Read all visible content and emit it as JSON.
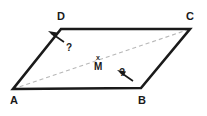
{
  "figure": {
    "type": "geometry-diagram",
    "shape": "parallelogram",
    "background_color": "#ffffff",
    "edge_color": "#1a1a1a",
    "diagonal_color": "#b8b8b8",
    "arrow_color": "#1a1a1a",
    "vertices": [
      {
        "id": "A",
        "label": "A",
        "x": 13,
        "y": 89,
        "label_x": 10,
        "label_y": 95
      },
      {
        "id": "B",
        "label": "B",
        "x": 141,
        "y": 88,
        "label_x": 138,
        "label_y": 95
      },
      {
        "id": "C",
        "label": "C",
        "x": 190,
        "y": 29,
        "label_x": 186,
        "label_y": 11
      },
      {
        "id": "D",
        "label": "D",
        "x": 61,
        "y": 29,
        "label_x": 57,
        "label_y": 11
      }
    ],
    "edges": [
      {
        "name": "side-AB",
        "from": "A",
        "to": "B",
        "style": "solid"
      },
      {
        "name": "side-BC",
        "from": "B",
        "to": "C",
        "style": "solid"
      },
      {
        "name": "side-CD",
        "from": "C",
        "to": "D",
        "style": "solid"
      },
      {
        "name": "side-DA",
        "from": "D",
        "to": "A",
        "style": "solid"
      }
    ],
    "diagonal": {
      "name": "diagonal-AC",
      "from": "A",
      "to": "C",
      "style": "dashed",
      "dash_pattern": "4 3"
    },
    "midpoint": {
      "id": "M",
      "label": "M",
      "marker": "x",
      "x": 99,
      "y": 59,
      "marker_x": 96,
      "marker_y": 54,
      "label_x": 94,
      "label_y": 62
    },
    "annotations": [
      {
        "name": "angle-d-unknown",
        "label": "?",
        "label_x": 66,
        "label_y": 43,
        "arrow_from_x": 64,
        "arrow_from_y": 42,
        "arrow_to_x": 48,
        "arrow_to_y": 31,
        "target_vertex": "D"
      },
      {
        "name": "angle-b-unknown",
        "label": "?",
        "label_x": 119,
        "label_y": 68,
        "arrow_from_x": 131,
        "arrow_from_y": 79,
        "arrow_to_x": 117,
        "arrow_to_y": 70,
        "target_vertex": "B"
      }
    ]
  }
}
